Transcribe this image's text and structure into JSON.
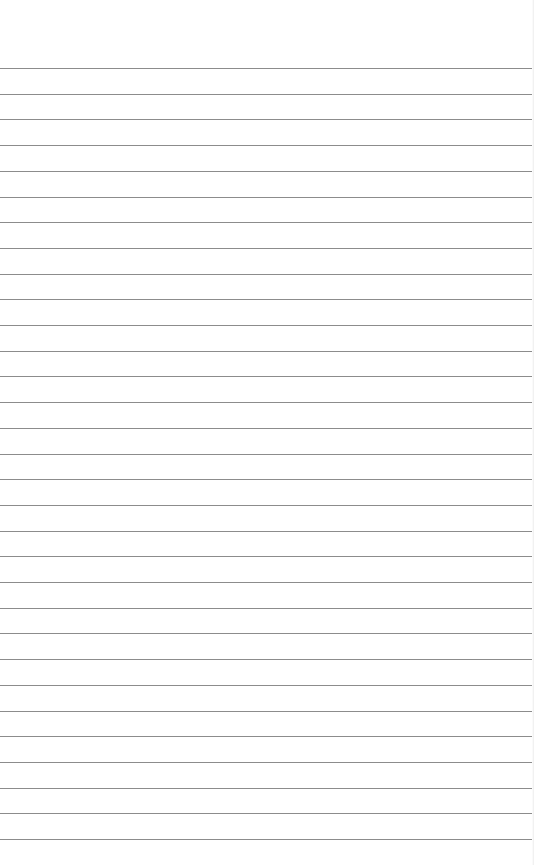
{
  "paper": {
    "type": "lined-paper",
    "background_color": "#ffffff",
    "line_color": "#8c8c8c",
    "line_count": 31,
    "first_line_y": 68,
    "line_spacing": 25.7
  }
}
